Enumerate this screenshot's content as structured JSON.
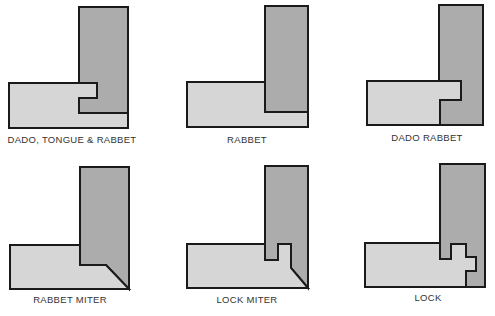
{
  "colors": {
    "vertical_board": "#acacac",
    "horizontal_board": "#d6d6d6",
    "outline": "#1a1a1a",
    "label": "#333333"
  },
  "joints": [
    {
      "id": "dado-tongue-rabbet",
      "label": "DADO, TONGUE & RABBET"
    },
    {
      "id": "rabbet",
      "label": "RABBET"
    },
    {
      "id": "dado-rabbet",
      "label": "DADO RABBET"
    },
    {
      "id": "rabbet-miter",
      "label": "RABBET MITER"
    },
    {
      "id": "lock-miter",
      "label": "LOCK MITER"
    },
    {
      "id": "lock",
      "label": "LOCK"
    }
  ]
}
